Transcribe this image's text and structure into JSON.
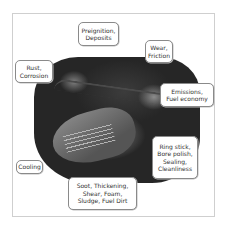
{
  "diagram": {
    "callouts": [
      {
        "id": "preignition",
        "lines": [
          "Preignition,",
          "Deposits"
        ]
      },
      {
        "id": "wear",
        "lines": [
          "Wear,",
          "Friction"
        ]
      },
      {
        "id": "rust",
        "lines": [
          "Rust,",
          "Corrosion"
        ]
      },
      {
        "id": "emissions",
        "lines": [
          "Emissions,",
          "Fuel economy"
        ]
      },
      {
        "id": "ringstick",
        "lines": [
          "Ring stick,",
          "Bore polish,",
          "Sealing,",
          "Cleanliness"
        ]
      },
      {
        "id": "cooling",
        "lines": [
          "Cooling"
        ]
      },
      {
        "id": "soot",
        "lines": [
          "Soot, Thickening,",
          "Shear, Foam,",
          "Sludge, Fuel Dirt"
        ]
      }
    ]
  },
  "colors": {
    "frame_border": "#cfcfcf",
    "callout_border": "#8a8a8a",
    "text": "#333333",
    "engine_dark": "#1f1f1f"
  }
}
